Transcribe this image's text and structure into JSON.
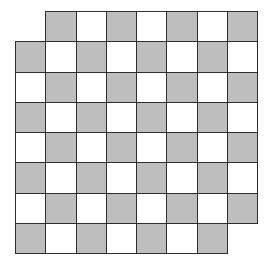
{
  "diagram": {
    "rows": 8,
    "cols": 8,
    "origin_x": 15,
    "origin_y": 11,
    "cell_size": 30.25,
    "removed_cells": [
      [
        0,
        0
      ],
      [
        7,
        7
      ]
    ],
    "gray_parity": "odd",
    "colors": {
      "gray": "#bebebe",
      "white": "#ffffff",
      "border": "#2e2e2e"
    }
  }
}
